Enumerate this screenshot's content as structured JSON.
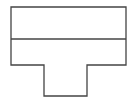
{
  "diagram": {
    "type": "t-shape-outline",
    "canvas": {
      "width": 135,
      "height": 106,
      "background": "#ffffff"
    },
    "stroke": {
      "color": "#444444",
      "width": 1.3
    },
    "outline_points": [
      [
        11,
        7
      ],
      [
        126,
        7
      ],
      [
        126,
        65
      ],
      [
        87,
        65
      ],
      [
        87,
        96
      ],
      [
        44,
        96
      ],
      [
        44,
        65
      ],
      [
        11,
        65
      ]
    ],
    "divider": {
      "x1": 11,
      "y1": 39,
      "x2": 126,
      "y2": 39
    }
  }
}
